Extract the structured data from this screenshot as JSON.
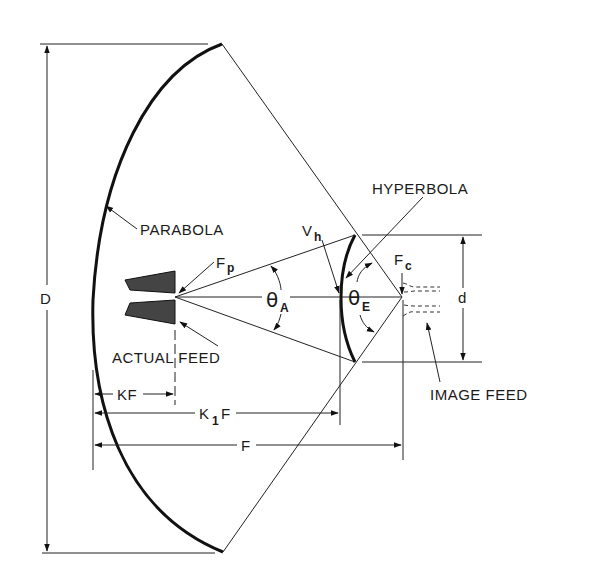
{
  "diagram": {
    "labels": {
      "parabola": "PARABOLA",
      "hyperbola": "HYPERBOLA",
      "actual_feed": "ACTUAL FEED",
      "image_feed": "IMAGE FEED",
      "diameter": "D",
      "subreflector_diameter": "d",
      "fp_main": "F",
      "fp_sub": "p",
      "fc_main": "F",
      "fc_sub": "c",
      "vh_main": "V",
      "vh_sub": "h",
      "theta_a_main": "θ",
      "theta_a_sub": "A",
      "theta_e_main": "θ",
      "theta_e_sub": "E",
      "kf": "KF",
      "k1f_k": "K",
      "k1f_sub": "1",
      "k1f_f": "F",
      "f": "F"
    },
    "colors": {
      "line": "#222222",
      "feed_fill": "#444444",
      "background": "#ffffff"
    }
  }
}
